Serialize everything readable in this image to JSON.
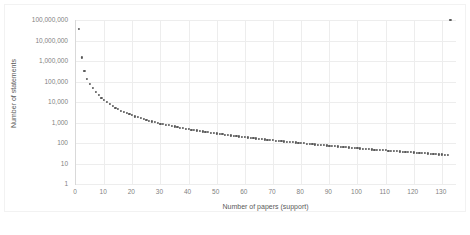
{
  "chart_data": {
    "type": "scatter",
    "title": "",
    "xlabel": "Number of papers (support)",
    "ylabel": "Number of statements",
    "xlim": [
      0,
      135
    ],
    "ylim": [
      1,
      100000000
    ],
    "yscale": "log",
    "grid": true,
    "legend": "none",
    "marker_color": "#595959",
    "gridline_color": "#ededed",
    "axis_color": "#d9d9d9",
    "label_color": "#7f7f7f",
    "xticks": [
      0,
      10,
      20,
      30,
      40,
      50,
      60,
      70,
      80,
      90,
      100,
      110,
      120,
      130
    ],
    "xtick_labels": [
      "0",
      "10",
      "20",
      "30",
      "40",
      "50",
      "60",
      "70",
      "80",
      "90",
      "100",
      "110",
      "120",
      "130"
    ],
    "yticks": [
      1,
      10,
      100,
      1000,
      10000,
      100000,
      1000000,
      10000000,
      100000000
    ],
    "ytick_labels": [
      "1",
      "10",
      "100",
      "1,000",
      "10,000",
      "100,000",
      "1,000,000",
      "10,000,000",
      "100,000,000"
    ],
    "x": [
      1,
      2,
      3,
      4,
      5,
      6,
      7,
      8,
      9,
      10,
      11,
      12,
      13,
      14,
      15,
      16,
      17,
      18,
      19,
      20,
      21,
      22,
      23,
      24,
      25,
      26,
      27,
      28,
      29,
      30,
      31,
      32,
      33,
      34,
      35,
      36,
      37,
      38,
      39,
      40,
      41,
      42,
      43,
      44,
      45,
      46,
      47,
      48,
      49,
      50,
      51,
      52,
      53,
      54,
      55,
      56,
      57,
      58,
      59,
      60,
      61,
      62,
      63,
      64,
      65,
      66,
      67,
      68,
      69,
      70,
      71,
      72,
      73,
      74,
      75,
      76,
      77,
      78,
      79,
      80,
      81,
      82,
      83,
      84,
      85,
      86,
      87,
      88,
      89,
      90,
      91,
      92,
      93,
      94,
      95,
      96,
      97,
      98,
      99,
      100,
      101,
      102,
      103,
      104,
      105,
      106,
      107,
      108,
      109,
      110,
      111,
      112,
      113,
      114,
      115,
      116,
      117,
      118,
      119,
      120,
      121,
      122,
      123,
      124,
      125,
      126,
      127,
      128,
      129,
      130,
      131,
      132,
      133
    ],
    "y": [
      38000000,
      1500000,
      330000,
      140000,
      78000,
      47000,
      31000,
      22000,
      16500,
      12500,
      9800,
      7900,
      6400,
      5300,
      4500,
      3850,
      3300,
      2900,
      2550,
      2250,
      2000,
      1800,
      1620,
      1470,
      1340,
      1230,
      1130,
      1040,
      960,
      890,
      830,
      780,
      730,
      680,
      640,
      600,
      565,
      535,
      505,
      478,
      452,
      430,
      408,
      388,
      370,
      352,
      336,
      321,
      307,
      293,
      280,
      268,
      257,
      247,
      237,
      227,
      218,
      210,
      202,
      194,
      187,
      180,
      174,
      168,
      162,
      156,
      151,
      146,
      141,
      136,
      132,
      128,
      124,
      120,
      116,
      112,
      109,
      106,
      103,
      100,
      97,
      94,
      91,
      88,
      86,
      83,
      81,
      79,
      76,
      74,
      72,
      70,
      68,
      66,
      64,
      63,
      61,
      59,
      58,
      56,
      55,
      53,
      52,
      51,
      49,
      48,
      47,
      46,
      45,
      44,
      43,
      42,
      41,
      40,
      39,
      38,
      37,
      36,
      36,
      35,
      34,
      33,
      33,
      32,
      31,
      30,
      30,
      29,
      28,
      28,
      27,
      26
    ]
  }
}
